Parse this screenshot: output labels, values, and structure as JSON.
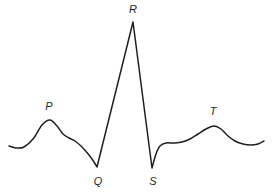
{
  "figure": {
    "background": "#ffffff",
    "stroke_color": "#1f1f1f",
    "stroke_width": 1.5,
    "labels": [
      {
        "id": "p",
        "text": "P",
        "x": 49,
        "y": 110
      },
      {
        "id": "q",
        "text": "Q",
        "x": 98,
        "y": 185
      },
      {
        "id": "r",
        "text": "R",
        "x": 133,
        "y": 13
      },
      {
        "id": "s",
        "text": "S",
        "x": 153,
        "y": 185
      },
      {
        "id": "t",
        "text": "T",
        "x": 213,
        "y": 115
      }
    ],
    "curve": [
      [
        9,
        146
      ],
      [
        16,
        148
      ],
      [
        24,
        147
      ],
      [
        33,
        139
      ],
      [
        42,
        125
      ],
      [
        50,
        120
      ],
      [
        57,
        126
      ],
      [
        63,
        134
      ],
      [
        69,
        138
      ],
      [
        75,
        141
      ],
      [
        82,
        147
      ],
      [
        89,
        155
      ],
      [
        94,
        162
      ],
      [
        97,
        167,
        1
      ],
      [
        133,
        22,
        1
      ],
      [
        152,
        168,
        1
      ],
      [
        156,
        154
      ],
      [
        160,
        146
      ],
      [
        166,
        143
      ],
      [
        174,
        143
      ],
      [
        182,
        142
      ],
      [
        190,
        139
      ],
      [
        198,
        134
      ],
      [
        206,
        129
      ],
      [
        214,
        126
      ],
      [
        221,
        129
      ],
      [
        228,
        136
      ],
      [
        235,
        141
      ],
      [
        243,
        144
      ],
      [
        251,
        145
      ],
      [
        258,
        144
      ],
      [
        264,
        141
      ]
    ]
  }
}
